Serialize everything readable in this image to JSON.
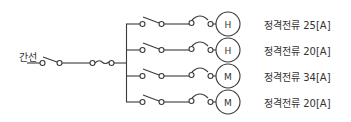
{
  "diagram": {
    "title": "",
    "main_line": {
      "label": "간선"
    },
    "branches": [
      {
        "load_symbol": "H",
        "rating_label": "정격전류",
        "rating_value": "25[A]"
      },
      {
        "load_symbol": "H",
        "rating_label": "정격전류",
        "rating_value": "20[A]"
      },
      {
        "load_symbol": "M",
        "rating_label": "정격전류",
        "rating_value": "34[A]"
      },
      {
        "load_symbol": "M",
        "rating_label": "정격전류",
        "rating_value": "20[A]"
      }
    ],
    "colors": {
      "line": "#3a3a3a",
      "text": "#333333",
      "background": "#ffffff"
    }
  }
}
